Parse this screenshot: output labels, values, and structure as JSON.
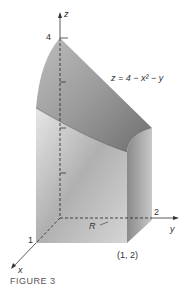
{
  "figure": {
    "caption": "FIGURE 3",
    "equation": "z = 4 − x² − y",
    "region_label": "R",
    "axes": {
      "x": "x",
      "y": "y",
      "z": "z"
    },
    "ticks": {
      "z_top": "4",
      "x_one": "1",
      "y_two": "2"
    },
    "corner_point": "(1, 2)"
  },
  "colors": {
    "surface_light": "#d8d8d8",
    "surface_dark": "#7a7a7a",
    "axis": "#333333",
    "text": "#333333"
  }
}
